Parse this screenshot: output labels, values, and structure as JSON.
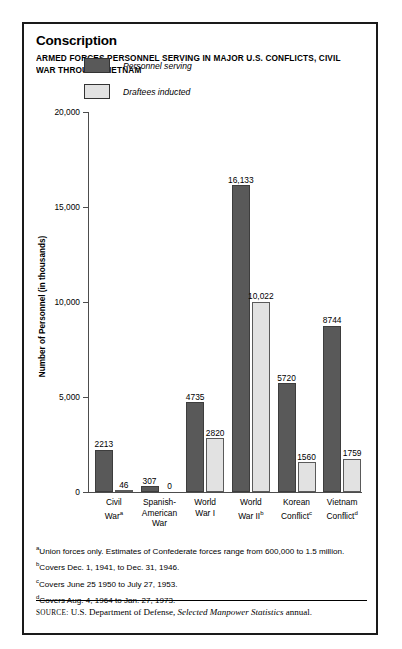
{
  "title": "Conscription",
  "subtitle": "ARMED FORCES PERSONNEL SERVING IN MAJOR U.S. CONFLICTS, CIVIL WAR THROUGH VIETNAM",
  "legend": {
    "series1": "Personnel serving",
    "series2": "Draftees inducted"
  },
  "notes": [
    {
      "marker": "a",
      "text": "Union forces only. Estimates of Confederate forces range from 600,000 to 1.5 million."
    },
    {
      "marker": "b",
      "text": "Covers Dec. 1, 1941, to Dec. 31, 1946."
    },
    {
      "marker": "c",
      "text": "Covers June 25 1950 to July 27, 1953."
    },
    {
      "marker": "d",
      "text": "Covers Aug. 4, 1964 to Jan. 27, 1973."
    }
  ],
  "source": {
    "label": "SOURCE:",
    "text_before": " U.S. Department of Defense, ",
    "italic": "Selected Manpower Statistics",
    "text_after": " annual."
  },
  "colors": {
    "series1": "#595959",
    "series2": "#e2e2e2",
    "axis": "#4d4d4d",
    "frame": "#1a1a1a"
  },
  "chart_data": {
    "type": "bar",
    "title": "Conscription",
    "subtitle": "ARMED FORCES PERSONNEL SERVING IN MAJOR U.S. CONFLICTS, CIVIL WAR THROUGH VIETNAM",
    "xlabel": "",
    "ylabel": "Number of Personnel (in thousands)",
    "ylim": [
      0,
      20000
    ],
    "yticks": [
      0,
      5000,
      10000,
      15000,
      20000
    ],
    "ytick_labels": [
      "0",
      "5,000",
      "10,000",
      "15,000",
      "20,000"
    ],
    "grid": false,
    "legend_position": "upper-left-inside",
    "categories": [
      "Civil War",
      "Spanish-American War",
      "World War I",
      "World War II",
      "Korean Conflict",
      "Vietnam Conflict"
    ],
    "category_labels": [
      {
        "lines": [
          "Civil",
          "War"
        ],
        "marker": "a"
      },
      {
        "lines": [
          "Spanish-",
          "American",
          "War"
        ],
        "marker": ""
      },
      {
        "lines": [
          "World",
          "War I"
        ],
        "marker": ""
      },
      {
        "lines": [
          "World",
          "War II"
        ],
        "marker": "b"
      },
      {
        "lines": [
          "Korean",
          "Conflict"
        ],
        "marker": "c"
      },
      {
        "lines": [
          "Vietnam",
          "Conflict"
        ],
        "marker": "d"
      }
    ],
    "series": [
      {
        "name": "Personnel serving",
        "color": "#595959",
        "values": [
          2213,
          307,
          4735,
          16133,
          5720,
          8744
        ],
        "labels": [
          "2213",
          "307",
          "4735",
          "16,133",
          "5720",
          "8744"
        ]
      },
      {
        "name": "Draftees inducted",
        "color": "#e2e2e2",
        "values": [
          46,
          0,
          2820,
          10022,
          1560,
          1759
        ],
        "labels": [
          "46",
          "0",
          "2820",
          "10,022",
          "1560",
          "1759"
        ]
      }
    ]
  }
}
